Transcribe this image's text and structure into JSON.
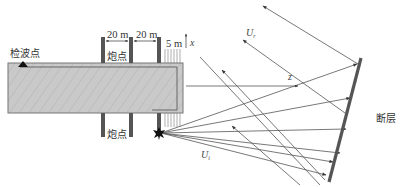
{
  "labels": {
    "geophone": "检波点",
    "shot_top": "炮点",
    "shot_bottom": "炮点",
    "fault": "断层",
    "spacing_1": "20 m",
    "spacing_2": "20 m",
    "spacing_3": "5 m",
    "axis_x": "x",
    "axis_z": "z",
    "wave_reflected": "U",
    "wave_reflected_sub": "r",
    "wave_incident": "U",
    "wave_incident_sub": "i"
  },
  "colors": {
    "block_fill": "#c8c8c8",
    "block_stroke": "#777777",
    "line": "#555555",
    "fault": "#555555",
    "text": "#333333"
  }
}
